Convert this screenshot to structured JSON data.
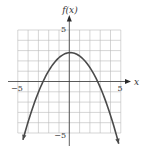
{
  "chart_data": {
    "type": "line",
    "title": "",
    "xlabel": "x",
    "ylabel": "f(x)",
    "xlim": [
      -5,
      5
    ],
    "ylim": [
      -5,
      5
    ],
    "grid": true,
    "grid_step": 1,
    "tick_labels": {
      "x": [
        {
          "value": -5,
          "label": "−5"
        },
        {
          "value": 5,
          "label": "5"
        }
      ],
      "y": [
        {
          "value": 5,
          "label": "5"
        },
        {
          "value": -5,
          "label": "−5"
        }
      ]
    },
    "series": [
      {
        "name": "f(x)",
        "description": "downward-opening parabola, vertex near (0, 2.8), x-intercepts near -2.6 and 2.8, arrows at both ends",
        "vertex": [
          0.1,
          2.8
        ],
        "x_intercepts": [
          -2.6,
          2.8
        ],
        "x": [
          -4.5,
          -4,
          -3,
          -2,
          -1,
          0,
          0.1,
          1,
          2,
          3,
          4,
          4.8
        ],
        "y": [
          -5.66,
          -4.0,
          -1.2,
          1.1,
          2.3,
          2.8,
          2.8,
          2.3,
          1.4,
          -0.7,
          -3.5,
          -6.0
        ],
        "end_arrows": true
      }
    ],
    "legend": null
  },
  "labels": {
    "y_axis_title": "f(x)",
    "x_axis_title": "x",
    "x_tick_neg": "−5",
    "x_tick_pos": "5",
    "y_tick_pos": "5",
    "y_tick_neg": "−5"
  },
  "colors": {
    "curve": "#4a4a4a",
    "grid": "#b8b8b8",
    "axis": "#3a3a3a"
  }
}
